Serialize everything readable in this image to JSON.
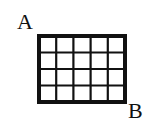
{
  "diagram": {
    "type": "grid",
    "corner_labels": {
      "top_left": "A",
      "bottom_right": "B"
    },
    "grid": {
      "columns": 5,
      "rows": 4
    },
    "colors": {
      "line": "#111111",
      "background": "#ffffff"
    }
  }
}
